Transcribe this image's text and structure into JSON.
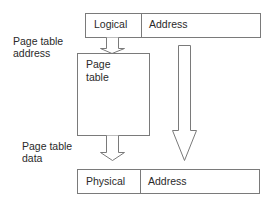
{
  "diagram": {
    "logical_address": {
      "cells": [
        {
          "label": "Logical"
        },
        {
          "label": "Address"
        }
      ]
    },
    "page_table": {
      "label_line1": "Page",
      "label_line2": "table"
    },
    "physical_address": {
      "cells": [
        {
          "label": "Physical"
        },
        {
          "label": "Address"
        }
      ]
    },
    "annotations": {
      "page_table_address_line1": "Page table",
      "page_table_address_line2": "address",
      "page_table_data_line1": "Page table",
      "page_table_data_line2": "data"
    },
    "colors": {
      "stroke": "#7a7a7a",
      "text": "#2a2a2a",
      "background": "#ffffff"
    }
  }
}
